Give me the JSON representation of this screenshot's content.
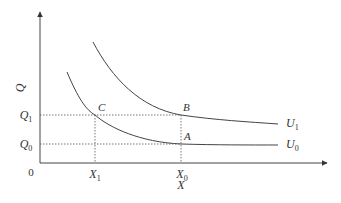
{
  "diagram": {
    "type": "indifference-curves",
    "axes": {
      "y_label": "Q",
      "x_label": "X",
      "origin_label": "0"
    },
    "ticks": {
      "y": [
        {
          "label": "Q",
          "sub": "1"
        },
        {
          "label": "Q",
          "sub": "0"
        }
      ],
      "x": [
        {
          "label": "X",
          "sub": "1"
        },
        {
          "label": "X",
          "sub": "0"
        }
      ]
    },
    "points": [
      {
        "name": "C"
      },
      {
        "name": "B"
      },
      {
        "name": "A"
      }
    ],
    "curves": [
      {
        "label": "U",
        "sub": "1"
      },
      {
        "label": "U",
        "sub": "0"
      }
    ],
    "colors": {
      "line": "#444444",
      "text": "#333333",
      "background": "#ffffff"
    }
  }
}
